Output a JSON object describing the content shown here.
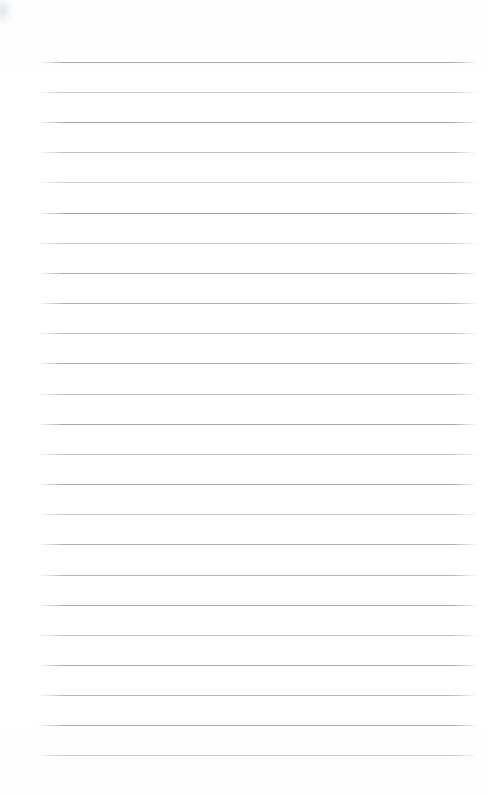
{
  "document": {
    "kind": "ruled-notepad-page",
    "orientation": "portrait",
    "page_width": 488,
    "page_height": 795,
    "background_color": "#fefefe",
    "has_text_content": false,
    "visible_text": ""
  },
  "ruling": {
    "line_color": "#9a9ea6",
    "line_count": 24,
    "first_line_y": 62,
    "line_spacing": 30.1,
    "line_left_x": 38,
    "line_right_x": 478,
    "line_thickness": 1,
    "lines": [
      {
        "index": 1,
        "y": 62,
        "opacity": 0.88
      },
      {
        "index": 2,
        "y": 92,
        "opacity": 0.55
      },
      {
        "index": 3,
        "y": 122,
        "opacity": 0.9
      },
      {
        "index": 4,
        "y": 152,
        "opacity": 0.62
      },
      {
        "index": 5,
        "y": 182,
        "opacity": 0.5
      },
      {
        "index": 6,
        "y": 213,
        "opacity": 0.92
      },
      {
        "index": 7,
        "y": 243,
        "opacity": 0.58
      },
      {
        "index": 8,
        "y": 273,
        "opacity": 0.85
      },
      {
        "index": 9,
        "y": 303,
        "opacity": 0.8
      },
      {
        "index": 10,
        "y": 333,
        "opacity": 0.72
      },
      {
        "index": 11,
        "y": 363,
        "opacity": 0.86
      },
      {
        "index": 12,
        "y": 394,
        "opacity": 0.68
      },
      {
        "index": 13,
        "y": 424,
        "opacity": 0.9
      },
      {
        "index": 14,
        "y": 454,
        "opacity": 0.6
      },
      {
        "index": 15,
        "y": 484,
        "opacity": 0.88
      },
      {
        "index": 16,
        "y": 514,
        "opacity": 0.56
      },
      {
        "index": 17,
        "y": 544,
        "opacity": 0.82
      },
      {
        "index": 18,
        "y": 575,
        "opacity": 0.74
      },
      {
        "index": 19,
        "y": 605,
        "opacity": 0.88
      },
      {
        "index": 20,
        "y": 635,
        "opacity": 0.64
      },
      {
        "index": 21,
        "y": 665,
        "opacity": 0.86
      },
      {
        "index": 22,
        "y": 695,
        "opacity": 0.7
      },
      {
        "index": 23,
        "y": 725,
        "opacity": 0.88
      },
      {
        "index": 24,
        "y": 755,
        "opacity": 0.52
      }
    ]
  },
  "margins": {
    "top_margin_height": 62,
    "bottom_margin_height": 40,
    "left_margin_width": 38,
    "right_margin_width": 10
  },
  "artifacts": {
    "corner_smudge": {
      "name": "scan-smudge",
      "x": 0,
      "y": 0,
      "width": 14,
      "height": 26,
      "color": "#aab0ba"
    }
  }
}
